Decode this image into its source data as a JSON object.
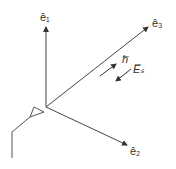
{
  "labels": {
    "e1": "ê₁",
    "e2": "ê₂",
    "e3": "ê₃",
    "h": "h̅",
    "Es": "E̅ₛ"
  },
  "colors": {
    "line": "#444444",
    "background": "#ffffff"
  }
}
